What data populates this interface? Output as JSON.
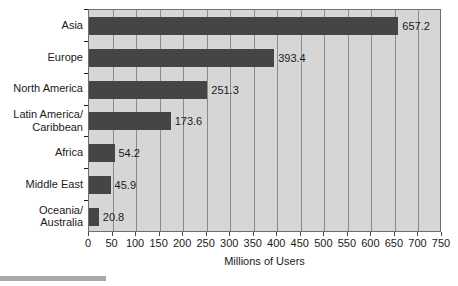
{
  "chart_data": {
    "type": "bar",
    "orientation": "horizontal",
    "title": "",
    "xlabel": "Millions of Users",
    "ylabel": "",
    "xlim": [
      0,
      750
    ],
    "xticks": [
      0,
      50,
      100,
      150,
      200,
      250,
      300,
      350,
      400,
      450,
      500,
      550,
      600,
      650,
      700,
      750
    ],
    "grid": "vertical",
    "legend": "none",
    "categories": [
      "Asia",
      "Europe",
      "North America",
      "Latin America/\nCaribbean",
      "Africa",
      "Middle East",
      "Oceania/\nAustralia"
    ],
    "values": [
      657.2,
      393.4,
      251.3,
      173.6,
      54.2,
      45.9,
      20.8
    ],
    "value_labels": [
      "657.2",
      "393.4",
      "251.3",
      "173.6",
      "54.2",
      "45.9",
      "20.8"
    ],
    "colors": {
      "bar": "#454545",
      "plot_background": "#d6d6d6",
      "gridline": "#8a8a8a",
      "axis": "#6e6e6e",
      "text": "#1a1a1a",
      "page_background": "#ffffff",
      "bottom_rule": "#a8a8a8"
    }
  }
}
